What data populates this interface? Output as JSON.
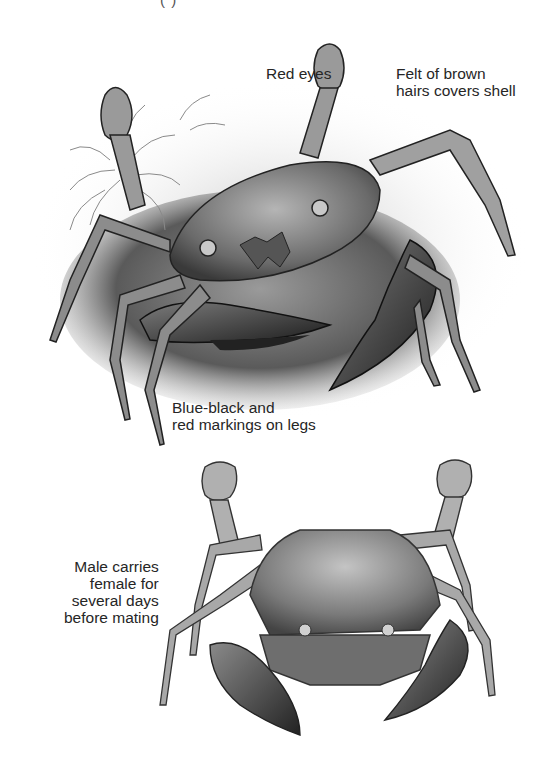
{
  "page": {
    "top_caption_fragment": "(          )",
    "colors": {
      "background": "#ffffff",
      "text": "#262626",
      "ink_dark": "#1e1e1e",
      "ink_mid": "#6e6e6e",
      "ink_light": "#bdbdbd"
    }
  },
  "illustrations": [
    {
      "id": "crab-top",
      "subject": "crab on rock among seaweed, side-front view"
    },
    {
      "id": "crab-bottom",
      "subject": "male crab carrying female, dorsal view"
    }
  ],
  "labels": {
    "red_eyes": [
      "Red eyes"
    ],
    "felt": [
      "Felt of brown",
      "hairs covers shell"
    ],
    "blue_black": [
      "Blue-black and",
      "red markings on legs"
    ],
    "male": [
      "Male carries",
      "female for",
      "several days",
      "before mating"
    ]
  }
}
